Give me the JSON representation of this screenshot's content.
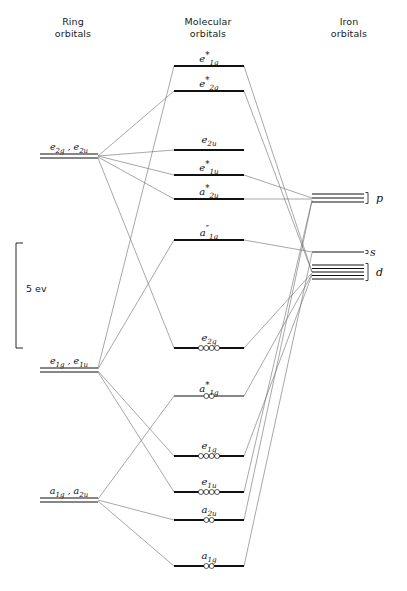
{
  "diagram": {
    "width": 407,
    "height": 591,
    "background": "#ffffff",
    "line_color": "#111111",
    "connector_color": "#6b6b6b"
  },
  "columns": {
    "left": {
      "heading": "Ring\norbitals",
      "x": 73,
      "y": 16
    },
    "center": {
      "heading": "Molecular\norbitals",
      "x": 208,
      "y": 16
    },
    "right": {
      "heading": "Iron\norbitals",
      "x": 349,
      "y": 16
    }
  },
  "energy_scale": {
    "label": "5 ev",
    "label_x": 20,
    "label_y": 290,
    "bracket_x": 16,
    "bracket_top": 243,
    "bracket_bottom": 348,
    "tick_width": 7
  },
  "ring_orbitals": [
    {
      "name": "e2g-e2u",
      "label_html": "e<sub>2g</sub> , e<sub>2u</sub>",
      "label_text": "e2g , e2u",
      "x1": 40,
      "x2": 98,
      "y": 156,
      "double_line": true,
      "gap": 4,
      "label_x": 69,
      "label_y": 141
    },
    {
      "name": "e1g-e1u",
      "label_html": "e<sub>1g</sub> , e<sub>1u</sub>",
      "label_text": "e1g , e1u",
      "x1": 40,
      "x2": 98,
      "y": 370,
      "double_line": true,
      "gap": 4,
      "label_x": 69,
      "label_y": 355
    },
    {
      "name": "a1g-a2u",
      "label_html": "a<sub>1g</sub> , a<sub>2u</sub>",
      "label_text": "a1g , a2u",
      "x1": 40,
      "x2": 98,
      "y": 500,
      "double_line": true,
      "gap": 4,
      "label_x": 69,
      "label_y": 485
    }
  ],
  "molecular_orbitals": [
    {
      "name": "e1g-star",
      "label_html": "e<sup>*</sup><sub>1g</sub>",
      "label_text": "e*1g",
      "x1": 174,
      "x2": 244,
      "y": 66,
      "electrons": 0,
      "thick": true,
      "label_x": 209,
      "label_y": 50
    },
    {
      "name": "e2g-star",
      "label_html": "e<sup>*</sup><sub>2g</sub>",
      "label_text": "e*2g",
      "x1": 174,
      "x2": 244,
      "y": 91,
      "electrons": 0,
      "thick": true,
      "label_x": 209,
      "label_y": 75
    },
    {
      "name": "e2u",
      "label_html": "e<sub>2u</sub>",
      "label_text": "e2u",
      "x1": 174,
      "x2": 244,
      "y": 150,
      "electrons": 0,
      "thick": true,
      "label_x": 209,
      "label_y": 134
    },
    {
      "name": "e1u-star",
      "label_html": "e<sup>*</sup><sub>1u</sub>",
      "label_text": "e*1u",
      "x1": 174,
      "x2": 244,
      "y": 175,
      "electrons": 0,
      "thick": true,
      "label_x": 209,
      "label_y": 159
    },
    {
      "name": "a2u-star",
      "label_html": "a<sup>*</sup><sub>2u</sub>",
      "label_text": "a*2u",
      "x1": 174,
      "x2": 244,
      "y": 199,
      "electrons": 0,
      "thick": true,
      "label_x": 209,
      "label_y": 183
    },
    {
      "name": "a1g-doubleprime",
      "label_html": "a<sup>&#8243;</sup><sub>1g</sub>",
      "label_text": "a″1g",
      "x1": 174,
      "x2": 244,
      "y": 240,
      "electrons": 0,
      "thick": true,
      "label_x": 209,
      "label_y": 224
    },
    {
      "name": "e2g",
      "label_html": "e<sub>2g</sub>",
      "label_text": "e2g",
      "x1": 174,
      "x2": 244,
      "y": 348,
      "electrons": 4,
      "thick": true,
      "label_x": 209,
      "label_y": 332
    },
    {
      "name": "a1g-star",
      "label_html": "a<sup>*</sup><sub>1g</sub>",
      "label_text": "a*1g",
      "x1": 174,
      "x2": 244,
      "y": 396,
      "electrons": 2,
      "thick": false,
      "label_x": 209,
      "label_y": 380
    },
    {
      "name": "e1g",
      "label_html": "e<sub>1g</sub>",
      "label_text": "e1g",
      "x1": 174,
      "x2": 244,
      "y": 456,
      "electrons": 4,
      "thick": true,
      "label_x": 209,
      "label_y": 440
    },
    {
      "name": "e1u",
      "label_html": "e<sub>1u</sub>",
      "label_text": "e1u",
      "x1": 174,
      "x2": 244,
      "y": 492,
      "electrons": 4,
      "thick": true,
      "label_x": 209,
      "label_y": 476
    },
    {
      "name": "a2u",
      "label_html": "a<sub>2u</sub>",
      "label_text": "a2u",
      "x1": 174,
      "x2": 244,
      "y": 520,
      "electrons": 2,
      "thick": true,
      "label_x": 209,
      "label_y": 504
    },
    {
      "name": "a1g",
      "label_html": "a<sub>1g</sub>",
      "label_text": "a1g",
      "x1": 174,
      "x2": 244,
      "y": 566,
      "electrons": 2,
      "thick": true,
      "label_x": 209,
      "label_y": 550
    }
  ],
  "iron_orbitals": [
    {
      "name": "p",
      "label": "p",
      "x1": 312,
      "x2": 364,
      "y_center": 198,
      "count": 3,
      "gap": 4,
      "brace_x": 368,
      "label_x": 376,
      "label_y": 192
    },
    {
      "name": "s",
      "label": "s",
      "x1": 312,
      "x2": 364,
      "y_center": 252,
      "count": 1,
      "gap": 0,
      "brace_x": 368,
      "label_x": 370,
      "label_y": 246
    },
    {
      "name": "d",
      "label": "d",
      "x1": 312,
      "x2": 364,
      "y_center": 272,
      "count": 5,
      "gap": 3.5,
      "brace_x": 368,
      "label_x": 376,
      "label_y": 266
    }
  ],
  "connectors": [
    {
      "from": "e2g-e2u",
      "to": "e2g-star",
      "x1": 98,
      "y1": 156,
      "x2": 174,
      "y2": 91
    },
    {
      "from": "e2g-e2u",
      "to": "e2u",
      "x1": 98,
      "y1": 156,
      "x2": 174,
      "y2": 150
    },
    {
      "from": "e2g-e2u",
      "to": "e1u-star",
      "x1": 98,
      "y1": 156,
      "x2": 174,
      "y2": 175
    },
    {
      "from": "e2g-e2u",
      "to": "a2u-star",
      "x1": 98,
      "y1": 157,
      "x2": 174,
      "y2": 199
    },
    {
      "from": "e2g-e2u",
      "to": "e2g",
      "x1": 98,
      "y1": 158,
      "x2": 174,
      "y2": 348
    },
    {
      "from": "e1g-e1u",
      "to": "a1g-doubleprime",
      "x1": 98,
      "y1": 369,
      "x2": 174,
      "y2": 240
    },
    {
      "from": "e1g-e1u",
      "to": "e1g",
      "x1": 98,
      "y1": 371,
      "x2": 174,
      "y2": 456
    },
    {
      "from": "e1g-e1u",
      "to": "e1u",
      "x1": 98,
      "y1": 372,
      "x2": 174,
      "y2": 492
    },
    {
      "from": "e1g-e1u",
      "to": "e1g-star",
      "x1": 98,
      "y1": 368,
      "x2": 174,
      "y2": 66
    },
    {
      "from": "a1g-a2u",
      "to": "a2u",
      "x1": 98,
      "y1": 500,
      "x2": 174,
      "y2": 520
    },
    {
      "from": "a1g-a2u",
      "to": "a1g",
      "x1": 98,
      "y1": 501,
      "x2": 174,
      "y2": 566
    },
    {
      "from": "a1g-a2u",
      "to": "a1g-star",
      "x1": 98,
      "y1": 499,
      "x2": 174,
      "y2": 396
    },
    {
      "from": "e1g-star",
      "to": "d",
      "x1": 244,
      "y1": 66,
      "x2": 312,
      "y2": 272
    },
    {
      "from": "e2g-star",
      "to": "d",
      "x1": 244,
      "y1": 91,
      "x2": 312,
      "y2": 272
    },
    {
      "from": "e1u-star",
      "to": "p",
      "x1": 244,
      "y1": 175,
      "x2": 312,
      "y2": 198
    },
    {
      "from": "a2u-star",
      "to": "p",
      "x1": 244,
      "y1": 199,
      "x2": 312,
      "y2": 199
    },
    {
      "from": "a1g-doubleprime",
      "to": "s",
      "x1": 244,
      "y1": 240,
      "x2": 312,
      "y2": 252
    },
    {
      "from": "e2g",
      "to": "d",
      "x1": 244,
      "y1": 348,
      "x2": 312,
      "y2": 273
    },
    {
      "from": "a1g-star",
      "to": "d",
      "x1": 244,
      "y1": 396,
      "x2": 312,
      "y2": 274
    },
    {
      "from": "e1g",
      "to": "d",
      "x1": 244,
      "y1": 456,
      "x2": 312,
      "y2": 275
    },
    {
      "from": "e1u",
      "to": "p",
      "x1": 244,
      "y1": 492,
      "x2": 312,
      "y2": 200
    },
    {
      "from": "a2u",
      "to": "p",
      "x1": 244,
      "y1": 520,
      "x2": 312,
      "y2": 201
    },
    {
      "from": "a1g",
      "to": "s",
      "x1": 244,
      "y1": 566,
      "x2": 312,
      "y2": 253
    }
  ]
}
